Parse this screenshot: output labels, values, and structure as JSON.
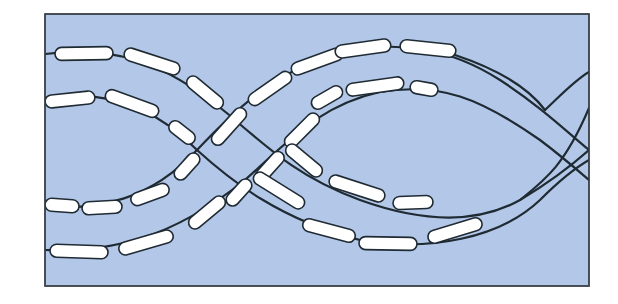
{
  "diagram": {
    "colors": {
      "background": "#b3c8e8",
      "frame": "#3a4048",
      "strand": "#1f2a33",
      "bead_fill": "#ffffff",
      "page": "#ffffff"
    },
    "frame": {
      "x": 45,
      "y": 14,
      "width": 544,
      "height": 272
    },
    "strands": [
      {
        "id": "strand-1",
        "path": "M45,54 C110,46 160,58 228,114 C270,150 300,178 360,200 C410,218 470,228 520,200 C550,182 572,165 589,150"
      },
      {
        "id": "strand-2",
        "path": "M45,98 C110,88 160,112 197,150 C230,180 280,220 360,240 C430,252 500,238 540,200 C560,180 575,168 589,160"
      },
      {
        "id": "strand-3",
        "path": "M45,207 C100,210 150,200 197,150 C240,104 280,70 340,52 C400,40 450,48 500,80 C540,106 565,130 589,150"
      },
      {
        "id": "strand-4",
        "path": "M45,250 C110,252 170,240 245,180 C290,140 320,105 380,92 C440,82 480,98 540,140 C560,155 575,168 589,180"
      },
      {
        "id": "strand-5",
        "path": "M455,55 C500,70 530,90 545,110"
      },
      {
        "id": "strand-6",
        "path": "M545,110 C560,96 575,80 589,72"
      },
      {
        "id": "strand-7",
        "path": "M520,200 C545,180 565,165 589,108"
      }
    ],
    "beads": [
      {
        "x": 55,
        "y": 47,
        "w": 58,
        "h": 13,
        "r": 6.5,
        "angle": -1
      },
      {
        "x": 123,
        "y": 55,
        "w": 58,
        "h": 13,
        "r": 6.5,
        "angle": 18
      },
      {
        "x": 183,
        "y": 86,
        "w": 44,
        "h": 13,
        "r": 6.5,
        "angle": 40
      },
      {
        "x": 45,
        "y": 93,
        "w": 50,
        "h": 13,
        "r": 6.5,
        "angle": -6
      },
      {
        "x": 104,
        "y": 97,
        "w": 56,
        "h": 13,
        "r": 6.5,
        "angle": 20
      },
      {
        "x": 167,
        "y": 126,
        "w": 30,
        "h": 13,
        "r": 6.5,
        "angle": 38
      },
      {
        "x": 45,
        "y": 199,
        "w": 34,
        "h": 13,
        "r": 6.5,
        "angle": 4
      },
      {
        "x": 82,
        "y": 201,
        "w": 40,
        "h": 13,
        "r": 6.5,
        "angle": -3
      },
      {
        "x": 130,
        "y": 188,
        "w": 40,
        "h": 13,
        "r": 6.5,
        "angle": -20
      },
      {
        "x": 171,
        "y": 160,
        "w": 32,
        "h": 13,
        "r": 6.5,
        "angle": -48
      },
      {
        "x": 206,
        "y": 120,
        "w": 46,
        "h": 13,
        "r": 6.5,
        "angle": -48
      },
      {
        "x": 245,
        "y": 82,
        "w": 50,
        "h": 13,
        "r": 6.5,
        "angle": -35
      },
      {
        "x": 290,
        "y": 55,
        "w": 54,
        "h": 13,
        "r": 6.5,
        "angle": -20
      },
      {
        "x": 335,
        "y": 42,
        "w": 56,
        "h": 13,
        "r": 6.5,
        "angle": -8
      },
      {
        "x": 400,
        "y": 42,
        "w": 56,
        "h": 13,
        "r": 6.5,
        "angle": 6
      },
      {
        "x": 50,
        "y": 245,
        "w": 58,
        "h": 13,
        "r": 6.5,
        "angle": 2
      },
      {
        "x": 118,
        "y": 236,
        "w": 56,
        "h": 13,
        "r": 6.5,
        "angle": -16
      },
      {
        "x": 185,
        "y": 206,
        "w": 44,
        "h": 13,
        "r": 6.5,
        "angle": -40
      },
      {
        "x": 223,
        "y": 186,
        "w": 32,
        "h": 13,
        "r": 6.5,
        "angle": -48
      },
      {
        "x": 252,
        "y": 160,
        "w": 36,
        "h": 13,
        "r": 6.5,
        "angle": -48
      },
      {
        "x": 280,
        "y": 124,
        "w": 44,
        "h": 13,
        "r": 6.5,
        "angle": -45
      },
      {
        "x": 310,
        "y": 91,
        "w": 34,
        "h": 13,
        "r": 6.5,
        "angle": -30
      },
      {
        "x": 346,
        "y": 80,
        "w": 58,
        "h": 13,
        "r": 6.5,
        "angle": -8
      },
      {
        "x": 410,
        "y": 82,
        "w": 28,
        "h": 13,
        "r": 6.5,
        "angle": 10
      },
      {
        "x": 282,
        "y": 154,
        "w": 44,
        "h": 13,
        "r": 6.5,
        "angle": 40
      },
      {
        "x": 328,
        "y": 182,
        "w": 58,
        "h": 13,
        "r": 6.5,
        "angle": 18
      },
      {
        "x": 393,
        "y": 196,
        "w": 40,
        "h": 13,
        "r": 6.5,
        "angle": -2
      },
      {
        "x": 250,
        "y": 184,
        "w": 58,
        "h": 13,
        "r": 6.5,
        "angle": 32
      },
      {
        "x": 302,
        "y": 224,
        "w": 54,
        "h": 13,
        "r": 6.5,
        "angle": 15
      },
      {
        "x": 359,
        "y": 237,
        "w": 58,
        "h": 13,
        "r": 6.5,
        "angle": 1
      },
      {
        "x": 427,
        "y": 224,
        "w": 56,
        "h": 13,
        "r": 6.5,
        "angle": -17
      }
    ]
  }
}
